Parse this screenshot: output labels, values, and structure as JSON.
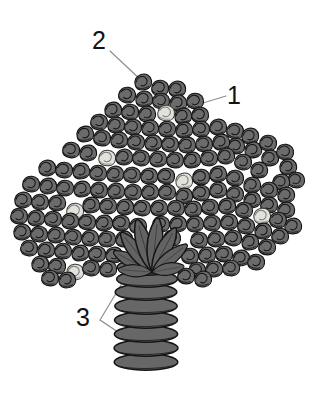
{
  "figure": {
    "background_color": "#ffffff",
    "width": 314,
    "height": 395,
    "line_color": "#111111",
    "leader_line_color": "#8a8a8a",
    "palette": {
      "floret_dark_fill": "#6b6b6b",
      "floret_dark_shade": "#5a5a5a",
      "floret_light_fill": "#e2e2dd",
      "floret_light_shade": "#d2d2cb",
      "leaf_fill": "#636363",
      "stem_fill": "#676767",
      "outline": "#141414"
    }
  },
  "callouts": [
    {
      "id": "1",
      "label": "1",
      "x": 227,
      "y": 83,
      "leader": {
        "from_x": 226,
        "from_y": 96,
        "to_x": 170,
        "to_y": 113
      },
      "points_to": "floret"
    },
    {
      "id": "2",
      "label": "2",
      "x": 92,
      "y": 28,
      "leader": {
        "from_x": 110,
        "from_y": 51,
        "to_x": 143,
        "to_y": 82
      },
      "points_to": "outer-floret"
    },
    {
      "id": "3",
      "label": "3",
      "x": 76,
      "y": 305,
      "leader": {
        "vertex_x": 100,
        "vertex_y": 320,
        "branch_a_x": 130,
        "branch_a_y": 270,
        "branch_b_x": 142,
        "branch_b_y": 348
      },
      "points_to": "stem-segments"
    }
  ],
  "structure": {
    "florets": {
      "count_dark": 176,
      "count_light": 7,
      "cluster_bounds": {
        "left": 16,
        "top": 74,
        "right": 302,
        "bottom": 282
      }
    },
    "leaves": {
      "count": 8,
      "origin_x": 152,
      "origin_y": 270
    },
    "stem": {
      "segment_count": 8,
      "top_y": 268,
      "bottom_y": 370,
      "center_x": 146,
      "half_width": 32
    }
  }
}
